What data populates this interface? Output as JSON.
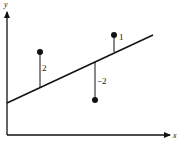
{
  "diagram": {
    "title": "",
    "y_axis_label": "y",
    "x_axis_label": "x",
    "line": {
      "from": [
        7,
        103
      ],
      "to": [
        153,
        35
      ]
    },
    "points": [
      {
        "id": "p1",
        "cx": 40,
        "cy": 52,
        "residual_label": "2",
        "line_y": 88
      },
      {
        "id": "p2",
        "cx": 95,
        "cy": 100,
        "residual_label": "−2",
        "line_y": 62
      },
      {
        "id": "p3",
        "cx": 114,
        "cy": 35,
        "residual_label": "1",
        "line_y": 53
      }
    ],
    "colors": {
      "stroke": "#111111",
      "background": "#ffffff"
    }
  }
}
